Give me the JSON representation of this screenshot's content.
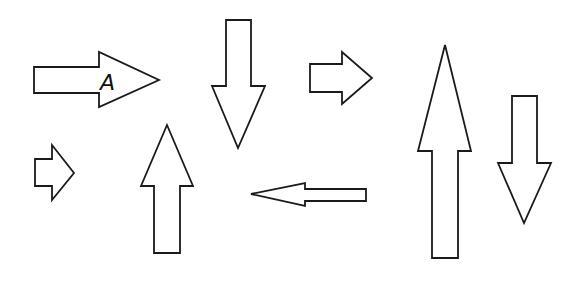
{
  "diagram": {
    "stroke_color": "#1a1a1a",
    "fill_color": "#ffffff",
    "background": "#ffffff",
    "arrows": [
      {
        "id": "arrow-a",
        "direction": "right",
        "label": "A",
        "points": "34,67 99,67 99,52 159,80 99,107 99,93 34,93"
      },
      {
        "id": "arrow-down-1",
        "direction": "down",
        "label": "",
        "points": "226,20 251,20 251,86 265,86 238,148 212,86 226,86"
      },
      {
        "id": "arrow-right-2",
        "direction": "right",
        "label": "",
        "points": "310,64 342,64 342,52 372,78 342,104 342,92 310,92"
      },
      {
        "id": "arrow-up-large",
        "direction": "up",
        "label": "",
        "points": "445,45 471,151 458,151 458,258 432,258 432,151 418,151"
      },
      {
        "id": "arrow-down-2",
        "direction": "down",
        "label": "",
        "points": "512,96 537,96 537,163 551,163 524,223 498,163 512,163"
      },
      {
        "id": "arrow-right-small",
        "direction": "right",
        "label": "",
        "points": "35,159 52,159 52,145 74,173 52,200 52,186 35,186"
      },
      {
        "id": "arrow-up-small",
        "direction": "up",
        "label": "",
        "points": "167,125 193,186 180,186 180,253 154,253 154,186 141,186"
      },
      {
        "id": "arrow-left",
        "direction": "left",
        "label": "",
        "points": "251,194 305,183 305,189 366,189 366,201 305,201 305,206"
      }
    ],
    "label_a": {
      "text": "A",
      "x": 100,
      "y": 90
    }
  }
}
